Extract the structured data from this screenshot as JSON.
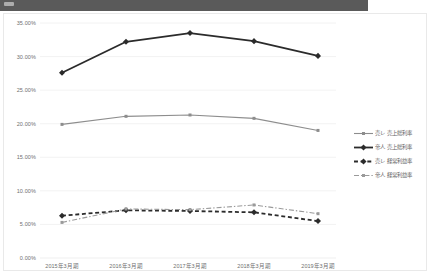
{
  "topbar": {
    "present": true
  },
  "chart_data": {
    "type": "line",
    "title": "",
    "xlabel": "",
    "ylabel": "",
    "ylim": [
      0,
      35
    ],
    "ytick_labels": [
      "0.00%",
      "5.00%",
      "10.00%",
      "15.00%",
      "20.00%",
      "25.00%",
      "30.00%",
      "35.00%"
    ],
    "ytick_values": [
      0,
      5,
      10,
      15,
      20,
      25,
      30,
      35
    ],
    "grid": true,
    "legend_position": "right",
    "categories": [
      "2015年3月期",
      "2016年3月期",
      "2017年3月期",
      "2018年3月期",
      "2019年3月期"
    ],
    "series": [
      {
        "name": "売レ 売上総利率",
        "values": [
          19.9,
          21.1,
          21.3,
          20.8,
          19.0
        ],
        "color": "#8d8d8d",
        "style": "solid",
        "width": 1.1,
        "marker": "square"
      },
      {
        "name": "帝人 売上総利率",
        "values": [
          27.6,
          32.2,
          33.5,
          32.3,
          30.1
        ],
        "color": "#2b2b2b",
        "style": "solid",
        "width": 1.8,
        "marker": "diamond"
      },
      {
        "name": "売レ 経常利益率",
        "values": [
          6.3,
          7.1,
          7.0,
          6.8,
          5.5
        ],
        "color": "#2b2b2b",
        "style": "dashed",
        "width": 1.8,
        "marker": "diamond"
      },
      {
        "name": "帝人 経常利益率",
        "values": [
          5.3,
          7.3,
          7.2,
          7.9,
          6.6
        ],
        "color": "#9a9a9a",
        "style": "dashdot",
        "width": 1.1,
        "marker": "square"
      }
    ]
  },
  "colors": {
    "topbar": "#5a5a5a",
    "card_border": "#e9e9e9",
    "grid": "#efefef",
    "tick_text": "#6f6f6f",
    "legend_text": "#666666"
  }
}
